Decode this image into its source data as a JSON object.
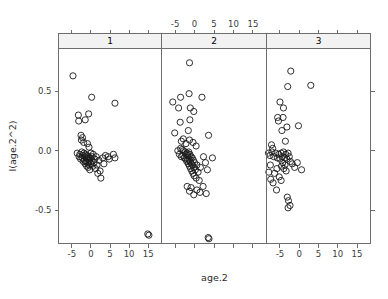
{
  "chart_data": {
    "type": "scatter",
    "title": "",
    "subtitle": "",
    "xlabel": "age.2",
    "ylabel": "I(age.2^2)",
    "xlim": [
      -8.5,
      18.5
    ],
    "ylim": [
      -0.78,
      0.86
    ],
    "xticks": [
      -5,
      0,
      5,
      10,
      15
    ],
    "xticklabels": [
      "-5",
      "0",
      "5",
      "10",
      "15"
    ],
    "yticks": [
      -0.5,
      0.0,
      0.5
    ],
    "yticklabels": [
      "-0.5",
      "0.0",
      "0.5"
    ],
    "grid": false,
    "legend": false,
    "legend_position": "none",
    "layout": "trellis-1x3",
    "strip_labels": [
      "1",
      "2",
      "3"
    ],
    "marker": "open-circle",
    "marker_size": 3.1,
    "marker_color": "#1a1a1a",
    "panels": [
      {
        "name": "1",
        "points": [
          [
            -4.7,
            0.63
          ],
          [
            0.2,
            0.45
          ],
          [
            6.3,
            0.4
          ],
          [
            -3.3,
            0.3
          ],
          [
            -3.2,
            0.25
          ],
          [
            -0.6,
            0.31
          ],
          [
            -1.5,
            0.26
          ],
          [
            -2.6,
            0.13
          ],
          [
            -2.5,
            0.09
          ],
          [
            -2.2,
            0.11
          ],
          [
            -1.9,
            0.07
          ],
          [
            -0.9,
            0.06
          ],
          [
            -0.5,
            0.03
          ],
          [
            -3.6,
            -0.02
          ],
          [
            -3.1,
            -0.05
          ],
          [
            -2.9,
            -0.03
          ],
          [
            -2.7,
            -0.07
          ],
          [
            -2.4,
            -0.01
          ],
          [
            -2.3,
            -0.06
          ],
          [
            -2.1,
            -0.04
          ],
          [
            -2.0,
            -0.09
          ],
          [
            -1.8,
            -0.02
          ],
          [
            -1.7,
            -0.08
          ],
          [
            -1.6,
            -0.05
          ],
          [
            -1.5,
            -0.11
          ],
          [
            -1.4,
            -0.03
          ],
          [
            -1.3,
            -0.09
          ],
          [
            -1.2,
            -0.06
          ],
          [
            -1.1,
            -0.13
          ],
          [
            -1.0,
            -0.04
          ],
          [
            -0.9,
            -0.1
          ],
          [
            -0.8,
            -0.07
          ],
          [
            -0.7,
            -0.14
          ],
          [
            -0.6,
            -0.05
          ],
          [
            -0.5,
            -0.12
          ],
          [
            -0.4,
            -0.08
          ],
          [
            -0.3,
            -0.16
          ],
          [
            -0.2,
            -0.06
          ],
          [
            -0.1,
            -0.11
          ],
          [
            0.0,
            -0.02
          ],
          [
            0.1,
            -0.09
          ],
          [
            0.3,
            -0.05
          ],
          [
            0.5,
            -0.13
          ],
          [
            0.6,
            -0.03
          ],
          [
            0.8,
            -0.1
          ],
          [
            1.0,
            -0.07
          ],
          [
            1.2,
            -0.15
          ],
          [
            1.4,
            -0.05
          ],
          [
            1.6,
            -0.12
          ],
          [
            1.8,
            -0.19
          ],
          [
            2.1,
            -0.08
          ],
          [
            2.4,
            -0.17
          ],
          [
            2.6,
            -0.23
          ],
          [
            3.1,
            -0.06
          ],
          [
            3.4,
            -0.11
          ],
          [
            3.8,
            -0.04
          ],
          [
            4.5,
            -0.05
          ],
          [
            4.8,
            -0.07
          ],
          [
            5.9,
            -0.03
          ],
          [
            6.3,
            -0.06
          ],
          [
            14.9,
            -0.7
          ],
          [
            15.2,
            -0.71
          ]
        ]
      },
      {
        "name": "2",
        "points": [
          [
            -1.3,
            0.74
          ],
          [
            -5.6,
            0.41
          ],
          [
            -3.6,
            0.45
          ],
          [
            -1.4,
            0.48
          ],
          [
            1.9,
            0.45
          ],
          [
            -4.1,
            0.36
          ],
          [
            -1.1,
            0.36
          ],
          [
            -0.2,
            0.33
          ],
          [
            -3.7,
            0.24
          ],
          [
            -1.2,
            0.26
          ],
          [
            -5.1,
            0.15
          ],
          [
            -1.6,
            0.17
          ],
          [
            3.6,
            0.13
          ],
          [
            -3.4,
            0.08
          ],
          [
            -2.9,
            0.1
          ],
          [
            -2.2,
            0.06
          ],
          [
            -1.3,
            0.09
          ],
          [
            -0.4,
            0.07
          ],
          [
            0.4,
            0.04
          ],
          [
            -4.3,
            0.0
          ],
          [
            -3.9,
            -0.03
          ],
          [
            -3.6,
            0.02
          ],
          [
            -3.4,
            -0.05
          ],
          [
            -3.2,
            0.01
          ],
          [
            -3.0,
            -0.04
          ],
          [
            -2.8,
            0.0
          ],
          [
            -2.6,
            -0.06
          ],
          [
            -2.4,
            -0.01
          ],
          [
            -2.3,
            -0.07
          ],
          [
            -2.2,
            -0.03
          ],
          [
            -2.0,
            -0.09
          ],
          [
            -1.9,
            -0.02
          ],
          [
            -1.8,
            -0.08
          ],
          [
            -1.7,
            -0.04
          ],
          [
            -1.6,
            -0.11
          ],
          [
            -1.5,
            -0.01
          ],
          [
            -1.4,
            -0.07
          ],
          [
            -1.3,
            -0.13
          ],
          [
            -1.2,
            -0.03
          ],
          [
            -1.1,
            -0.09
          ],
          [
            -1.0,
            -0.15
          ],
          [
            -0.9,
            -0.05
          ],
          [
            -0.8,
            -0.11
          ],
          [
            -0.7,
            -0.17
          ],
          [
            -0.6,
            -0.06
          ],
          [
            -0.5,
            -0.12
          ],
          [
            -0.4,
            -0.19
          ],
          [
            -0.3,
            -0.08
          ],
          [
            -0.2,
            -0.14
          ],
          [
            -0.1,
            -0.21
          ],
          [
            0.0,
            -0.1
          ],
          [
            0.2,
            -0.16
          ],
          [
            0.4,
            -0.23
          ],
          [
            0.6,
            -0.12
          ],
          [
            0.9,
            -0.18
          ],
          [
            1.2,
            -0.25
          ],
          [
            1.5,
            -0.14
          ],
          [
            2.3,
            -0.05
          ],
          [
            2.8,
            -0.1
          ],
          [
            3.3,
            -0.16
          ],
          [
            -1.9,
            -0.3
          ],
          [
            -1.3,
            -0.34
          ],
          [
            -0.9,
            -0.31
          ],
          [
            -0.2,
            -0.37
          ],
          [
            0.6,
            -0.33
          ],
          [
            1.4,
            -0.35
          ],
          [
            2.2,
            -0.3
          ],
          [
            3.0,
            -0.36
          ],
          [
            4.6,
            -0.06
          ],
          [
            3.5,
            -0.73
          ],
          [
            3.7,
            -0.74
          ]
        ]
      },
      {
        "name": "3",
        "points": [
          [
            -2.2,
            0.67
          ],
          [
            -3.0,
            0.54
          ],
          [
            3.0,
            0.55
          ],
          [
            -5.0,
            0.41
          ],
          [
            -4.1,
            0.36
          ],
          [
            -5.6,
            0.28
          ],
          [
            -5.4,
            0.25
          ],
          [
            -4.2,
            0.28
          ],
          [
            -4.5,
            0.17
          ],
          [
            -3.2,
            0.2
          ],
          [
            -0.2,
            0.21
          ],
          [
            -7.2,
            0.05
          ],
          [
            -6.9,
            0.02
          ],
          [
            -3.6,
            0.08
          ],
          [
            -8.0,
            -0.02
          ],
          [
            -7.6,
            -0.04
          ],
          [
            -7.1,
            -0.01
          ],
          [
            -6.6,
            -0.05
          ],
          [
            -6.1,
            -0.02
          ],
          [
            -5.7,
            -0.06
          ],
          [
            -5.3,
            -0.03
          ],
          [
            -5.0,
            -0.07
          ],
          [
            -4.7,
            -0.02
          ],
          [
            -4.4,
            -0.05
          ],
          [
            -4.1,
            -0.01
          ],
          [
            -3.8,
            -0.06
          ],
          [
            -3.5,
            -0.03
          ],
          [
            -3.2,
            -0.07
          ],
          [
            -2.9,
            -0.02
          ],
          [
            -2.6,
            -0.05
          ],
          [
            -2.3,
            -0.09
          ],
          [
            -4.6,
            -0.13
          ],
          [
            -4.3,
            -0.1
          ],
          [
            -4.0,
            -0.15
          ],
          [
            -3.7,
            -0.12
          ],
          [
            -3.4,
            -0.17
          ],
          [
            -5.8,
            -0.15
          ],
          [
            -6.4,
            -0.19
          ],
          [
            -7.5,
            -0.12
          ],
          [
            -7.9,
            -0.18
          ],
          [
            -5.2,
            -0.22
          ],
          [
            -4.7,
            -0.25
          ],
          [
            -6.8,
            -0.27
          ],
          [
            -7.4,
            -0.24
          ],
          [
            -1.8,
            -0.11
          ],
          [
            -1.2,
            -0.14
          ],
          [
            -0.5,
            -0.1
          ],
          [
            0.6,
            -0.16
          ],
          [
            -5.9,
            -0.33
          ],
          [
            -3.1,
            -0.39
          ],
          [
            -2.8,
            -0.42
          ],
          [
            -2.9,
            -0.48
          ],
          [
            -2.4,
            -0.46
          ]
        ]
      }
    ]
  },
  "axes": {
    "x_title": "age.2",
    "y_title": "I(age.2^2)",
    "top_axis_labels": [
      "-5",
      "0",
      "5",
      "10",
      "15"
    ],
    "bottom_axis_labels": [
      "-5",
      "0",
      "5",
      "10",
      "15"
    ],
    "y_axis_labels": [
      "0.5",
      "0.0",
      "-0.5"
    ]
  },
  "strips": [
    {
      "label": "1"
    },
    {
      "label": "2"
    },
    {
      "label": "3"
    }
  ]
}
